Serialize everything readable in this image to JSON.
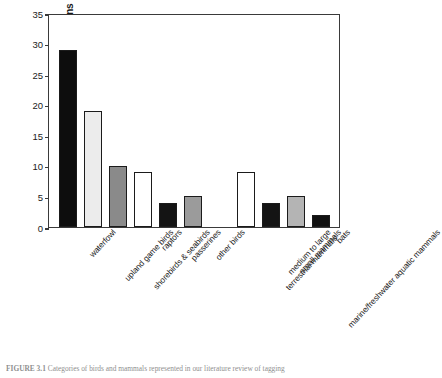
{
  "figure": {
    "caption_label": "FIGURE 3.1",
    "caption_text": "Categories of birds and mammals represented in our literature review of tagging"
  },
  "chart_data": {
    "type": "bar",
    "title": "",
    "xlabel": "",
    "ylabel": "Number of Publications",
    "ylim": [
      0,
      35
    ],
    "ytick_values": [
      0,
      5,
      10,
      15,
      20,
      25,
      30,
      35
    ],
    "ytick_labels": [
      "0",
      "5",
      "10",
      "15",
      "20",
      "25",
      "30",
      "35"
    ],
    "grid": false,
    "legend": false,
    "categories": [
      "waterfowl",
      "upland game birds",
      "shorebirds & seabirds",
      "raptors",
      "passerines",
      "other birds",
      "medium to large terrestrial mammals",
      "small mammals",
      "marine/freshwater aquatic mammals",
      "bats"
    ],
    "values": [
      29,
      19,
      10,
      9,
      4,
      5,
      9,
      4,
      5,
      2
    ],
    "bar_colors": [
      "#0d0d0d",
      "#ececec",
      "#8a8a8a",
      "#ffffff",
      "#141414",
      "#9b9b9b",
      "#ffffff",
      "#141414",
      "#b4b4b4",
      "#111111"
    ],
    "groups": [
      {
        "name": "birds",
        "start_index": 0,
        "count": 6
      },
      {
        "name": "mammals",
        "start_index": 6,
        "count": 4
      }
    ],
    "bars": [
      {
        "label": "waterfowl",
        "label_line2": "",
        "value": 29,
        "color": "#0d0d0d",
        "x": 10,
        "w": 18
      },
      {
        "label": "upland game birds",
        "label_line2": "",
        "value": 19,
        "color": "#ececec",
        "x": 35,
        "w": 18
      },
      {
        "label": "shorebirds & seabirds",
        "label_line2": "",
        "value": 10,
        "color": "#8a8a8a",
        "x": 60,
        "w": 18
      },
      {
        "label": "raptors",
        "label_line2": "",
        "value": 9,
        "color": "#ffffff",
        "x": 85,
        "w": 18
      },
      {
        "label": "passerines",
        "label_line2": "",
        "value": 4,
        "color": "#141414",
        "x": 110,
        "w": 18
      },
      {
        "label": "other birds",
        "label_line2": "",
        "value": 5,
        "color": "#9b9b9b",
        "x": 135,
        "w": 18
      },
      {
        "label": "medium to large",
        "label_line2": "terrestrial mammals",
        "value": 9,
        "color": "#ffffff",
        "x": 188,
        "w": 18
      },
      {
        "label": "small mammals",
        "label_line2": "",
        "value": 4,
        "color": "#141414",
        "x": 213,
        "w": 18
      },
      {
        "label": "marine/freshwater aquatic mammals",
        "label_line2": "",
        "value": 5,
        "color": "#b4b4b4",
        "x": 238,
        "w": 18
      },
      {
        "label": "bats",
        "label_line2": "",
        "value": 2,
        "color": "#111111",
        "x": 263,
        "w": 18
      }
    ]
  }
}
